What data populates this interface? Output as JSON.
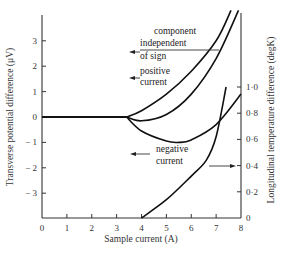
{
  "chart_data": {
    "type": "line",
    "title": "",
    "xlabel": "Sample current (A)",
    "ylabel": "Transverse potential difference (μV)",
    "y2label": "Longitudinal temperature difference (degK)",
    "xlim": [
      0,
      8
    ],
    "ylim": [
      -4,
      4
    ],
    "y2lim": [
      0,
      1.0
    ],
    "x_ticks": [
      "0",
      "1",
      "2",
      "3",
      "4",
      "5",
      "6",
      "7",
      "8"
    ],
    "y_ticks": [
      "3",
      "2",
      "1",
      "0",
      "− 1",
      "− 2",
      "− 3"
    ],
    "y2_ticks": [
      "1·0",
      "0·8",
      "0·6",
      "0·4",
      "0·2",
      "0"
    ],
    "grid": false,
    "series": [
      {
        "name": "component independent of sign",
        "axis": "left",
        "x": [
          0,
          3.4,
          4.0,
          5.0,
          6.0,
          7.0,
          7.6
        ],
        "y": [
          0,
          0,
          0.25,
          0.9,
          1.8,
          3.0,
          4.2
        ]
      },
      {
        "name": "positive current",
        "axis": "left",
        "x": [
          0,
          3.4,
          4.0,
          5.0,
          6.0,
          7.0,
          7.9
        ],
        "y": [
          0,
          0,
          -0.15,
          0.1,
          0.9,
          2.3,
          4.2
        ]
      },
      {
        "name": "negative current",
        "axis": "left",
        "x": [
          0,
          3.4,
          4.0,
          5.0,
          5.5,
          6.0,
          7.0,
          8.0
        ],
        "y": [
          0,
          0,
          -0.55,
          -0.95,
          -1.0,
          -0.9,
          -0.3,
          0.9
        ]
      },
      {
        "name": "longitudinal temperature difference",
        "axis": "right",
        "x": [
          4.0,
          5.0,
          6.0,
          6.6,
          7.0,
          7.4
        ],
        "y": [
          0,
          0.14,
          0.32,
          0.44,
          0.62,
          1.0
        ]
      }
    ],
    "annotations": [
      "component independent of sign",
      "positive current",
      "negative current"
    ]
  },
  "labels": {
    "annot_component_1": "component",
    "annot_component_2": "independent",
    "annot_component_3": "of sign",
    "annot_positive_1": "positive",
    "annot_positive_2": "current",
    "annot_negative_1": "negative",
    "annot_negative_2": "current"
  }
}
